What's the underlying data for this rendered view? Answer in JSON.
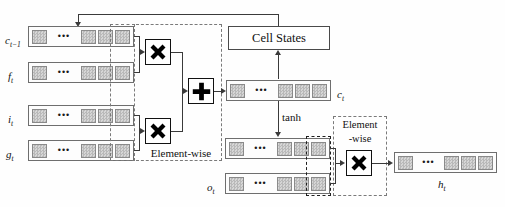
{
  "diagram": {
    "type": "lstm-cell-block-diagram",
    "canvas": {
      "width": 505,
      "height": 207
    },
    "colors": {
      "background": "#fefefe",
      "cell_fill": "#c8c8c8",
      "vector_border": "#6e6e6e",
      "operator_fill": "#000000",
      "line": "#3a3a3a",
      "dashed_group": "#7a7a7a"
    }
  },
  "vectors": [
    {
      "id": "c_prev",
      "label": "c",
      "sub": "t−1",
      "cells": 4,
      "ellipsis_after": 1
    },
    {
      "id": "f_t",
      "label": "f",
      "sub": "t",
      "cells": 4,
      "ellipsis_after": 1
    },
    {
      "id": "i_t",
      "label": "i",
      "sub": "t",
      "cells": 4,
      "ellipsis_after": 1
    },
    {
      "id": "g_t",
      "label": "g",
      "sub": "t",
      "cells": 4,
      "ellipsis_after": 1
    },
    {
      "id": "c_t",
      "label": "c",
      "sub": "t",
      "cells": 4,
      "ellipsis_after": 1
    },
    {
      "id": "tanh_c",
      "label": "",
      "sub": "",
      "cells": 4,
      "ellipsis_after": 1
    },
    {
      "id": "o_t",
      "label": "o",
      "sub": "t",
      "cells": 4,
      "ellipsis_after": 1
    },
    {
      "id": "h_t",
      "label": "h",
      "sub": "t",
      "cells": 4,
      "ellipsis_after": 1
    }
  ],
  "operators": [
    {
      "id": "mul_forget",
      "symbol": "multiply",
      "glyph": "✖"
    },
    {
      "id": "mul_input",
      "symbol": "multiply",
      "glyph": "✖"
    },
    {
      "id": "add_state",
      "symbol": "plus",
      "glyph": "✚"
    },
    {
      "id": "mul_output",
      "symbol": "multiply",
      "glyph": "✖"
    }
  ],
  "boxes": {
    "cell_states": "Cell States"
  },
  "annotations": {
    "elementwise_left": "Element-wise",
    "elementwise_right_line1": "Element",
    "elementwise_right_line2": "-wise",
    "tanh": "tanh"
  }
}
